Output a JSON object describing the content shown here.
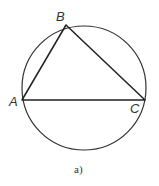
{
  "diagram": {
    "caption": "a)",
    "circle": {
      "cx": 84,
      "cy": 88,
      "r": 62
    },
    "vertices": [
      {
        "name": "A",
        "x": 22,
        "y": 100
      },
      {
        "name": "B",
        "x": 66,
        "y": 25
      },
      {
        "name": "C",
        "x": 145,
        "y": 100
      }
    ],
    "labels": {
      "A": "A",
      "B": "B",
      "C": "C"
    }
  }
}
